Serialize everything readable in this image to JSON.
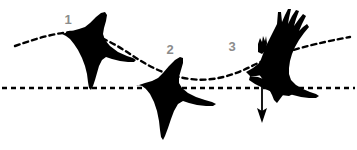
{
  "figure": {
    "background_color": "#ffffff",
    "width": 357,
    "height": 150
  },
  "colors": {
    "silhouette": "#000000",
    "label_grey": "#8c8c8c",
    "dashed_line": "#000000",
    "arrow": "#000000"
  },
  "labels": [
    {
      "id": "1",
      "text": "1",
      "x": 68,
      "y": 24
    },
    {
      "id": "2",
      "text": "2",
      "x": 170,
      "y": 54
    },
    {
      "id": "3",
      "text": "3",
      "x": 232,
      "y": 51
    }
  ],
  "birds": [
    {
      "id": "bird-1",
      "label": "1",
      "pose": "wings-up-downstroke-start",
      "center_x": 100,
      "center_y": 50
    },
    {
      "id": "bird-2",
      "label": "2",
      "pose": "wings-spread-glide",
      "center_x": 185,
      "center_y": 100
    },
    {
      "id": "bird-3",
      "label": "3",
      "pose": "wings-raised-fingered-upstroke",
      "center_x": 290,
      "center_y": 55
    }
  ],
  "trajectory": {
    "name": "undulating-flight-path",
    "style": "dashed",
    "points_description": "rises from left, peaks near bird 1, dips to trough near bird 2, rises again past bird 3"
  },
  "reference_line": {
    "name": "horizontal-reference-line",
    "style": "dashed",
    "y": 88
  },
  "arrow": {
    "name": "descent-arrow",
    "direction": "down",
    "x": 262,
    "y_start": 80,
    "y_end": 122
  }
}
